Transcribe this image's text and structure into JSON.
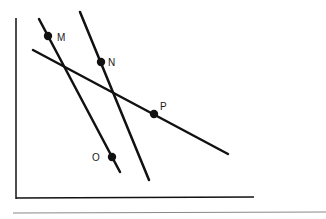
{
  "diagram": {
    "type": "geometry-lines-on-axes",
    "axes": {
      "y_axis": {
        "x": 16,
        "y1": 18,
        "y2": 199
      },
      "x_axis": {
        "y": 198,
        "x1": 16,
        "x2": 254
      }
    },
    "bottom_rule": {
      "y": 213,
      "x1": 13,
      "x2": 326
    },
    "lines": [
      {
        "id": "line-MO",
        "x1": 39,
        "y1": 19,
        "x2": 120,
        "y2": 172,
        "points": [
          "M",
          "O"
        ]
      },
      {
        "id": "line-N",
        "x1": 80,
        "y1": 12,
        "x2": 149,
        "y2": 180,
        "points": [
          "N"
        ]
      },
      {
        "id": "line-P",
        "x1": 33,
        "y1": 50,
        "x2": 228,
        "y2": 154,
        "points": [
          "P"
        ]
      }
    ],
    "points": [
      {
        "label": "M",
        "cx": 48,
        "cy": 36,
        "lx": 57,
        "ly": 41
      },
      {
        "label": "N",
        "cx": 101,
        "cy": 62,
        "lx": 108,
        "ly": 66
      },
      {
        "label": "P",
        "cx": 154,
        "cy": 114,
        "lx": 160,
        "ly": 110
      },
      {
        "label": "O",
        "cx": 112,
        "cy": 157,
        "lx": 92,
        "ly": 161
      }
    ],
    "colors": {
      "stroke": "#111111",
      "point": "#111111",
      "rule": "#888888"
    }
  }
}
